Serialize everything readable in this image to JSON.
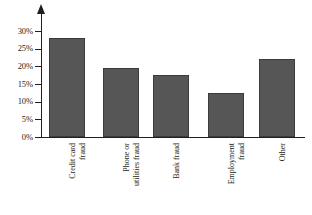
{
  "chart_data": {
    "type": "bar",
    "title": "",
    "subtitle": "",
    "xlabel": "",
    "ylabel": "",
    "categories": [
      "Credit card fraud",
      "Phone or utilities fraud",
      "Bank fraud",
      "Employment fraud",
      "Other"
    ],
    "values": [
      28,
      19.5,
      17.5,
      12.5,
      22
    ],
    "ylim": [
      0,
      30
    ],
    "ytick_labels": [
      "0%",
      "5%",
      "10%",
      "15%",
      "20%",
      "25%",
      "30%"
    ],
    "ytick_values": [
      0,
      5,
      10,
      15,
      20,
      25,
      30
    ],
    "grid": false,
    "legend": null,
    "bar_color": "#565656",
    "bar_border_color": "#3b3b3b",
    "axis_color": "#231f20",
    "background_color": "#ffffff",
    "y_axis_has_arrow": true,
    "category_label_rotation_degrees": -90
  },
  "axis": {
    "y_labels": [
      {
        "text": "30%",
        "value": 30
      },
      {
        "text": "25%",
        "value": 25
      },
      {
        "text": "20%",
        "value": 20
      },
      {
        "text": "15%",
        "value": 15
      },
      {
        "text": "10%",
        "value": 10
      },
      {
        "text": "5%",
        "value": 5
      },
      {
        "text": "0%",
        "value": 0
      }
    ]
  },
  "bars": [
    {
      "label_line1": "Credit card",
      "label_line2": "fraud",
      "value": 28
    },
    {
      "label_line1": "Phone or",
      "label_line2": "utilities fraud",
      "value": 19.5
    },
    {
      "label_line1": "Bank fraud",
      "label_line2": "",
      "value": 17.5
    },
    {
      "label_line1": "Employment",
      "label_line2": "fraud",
      "value": 12.5
    },
    {
      "label_line1": "Other",
      "label_line2": "",
      "value": 22
    }
  ]
}
